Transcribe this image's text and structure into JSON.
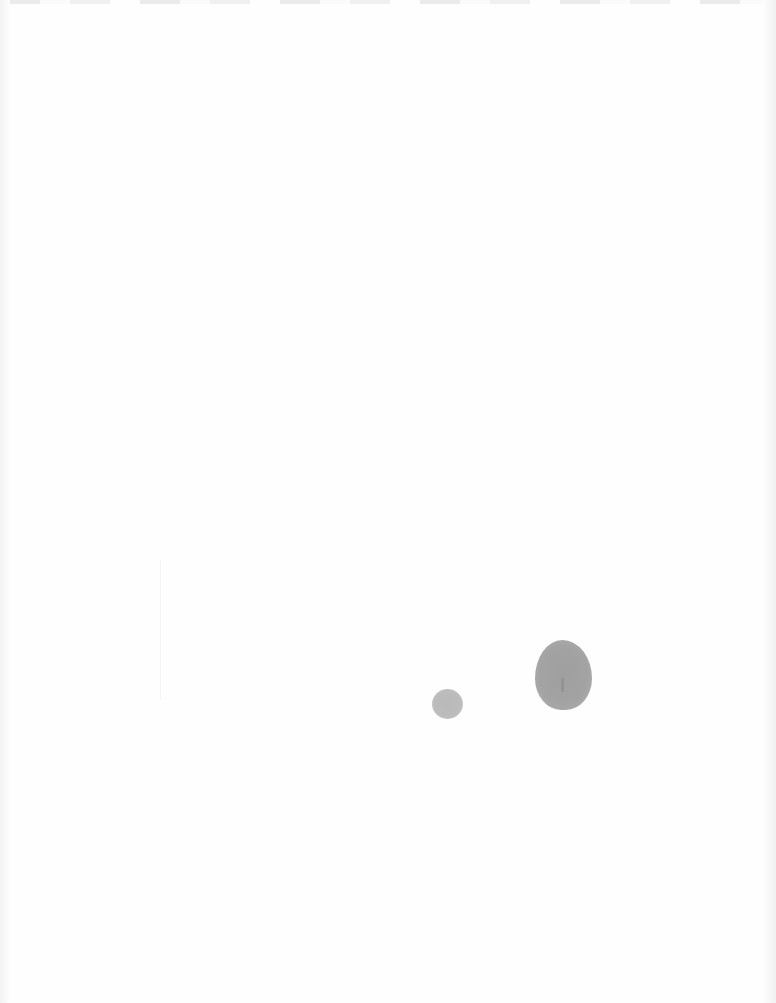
{
  "document": {
    "type": "blank scanned page",
    "text_content": "",
    "marks": [
      {
        "kind": "stain",
        "size": "small",
        "color": "#bbbbbb"
      },
      {
        "kind": "stain",
        "size": "large",
        "color": "#a0a0a0"
      }
    ]
  },
  "colors": {
    "paper": "#fefefe",
    "stain_small": "#bbbbbb",
    "stain_large": "#a0a0a0"
  }
}
